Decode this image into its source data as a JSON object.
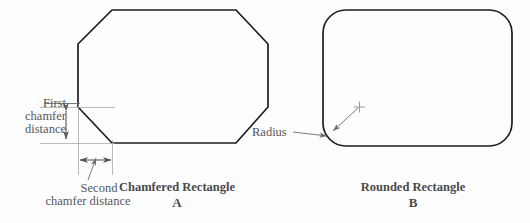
{
  "figure": {
    "background_color": "#fdfdfd",
    "line_color": "#1d1d1f",
    "annotation_color": "#58585a",
    "shapes": [
      {
        "id": "chamfered-rectangle",
        "name": "Chamfered Rectangle",
        "letter": "A",
        "caption": "Chamfered Rectangle",
        "dimensions": [
          {
            "id": "first-chamfer-distance",
            "label_line_1": "First",
            "label_line_2": "chamfer",
            "label_line_3": "distance",
            "orientation": "vertical"
          },
          {
            "id": "second-chamfer-distance",
            "label_line_1": "Second",
            "label_line_2": "chamfer distance",
            "orientation": "horizontal"
          }
        ]
      },
      {
        "id": "rounded-rectangle",
        "name": "Rounded Rectangle",
        "letter": "B",
        "caption": "Rounded Rectangle",
        "dimensions": [
          {
            "id": "radius",
            "label_line_1": "Radius",
            "orientation": "leader"
          }
        ]
      }
    ]
  },
  "labels": {
    "first_chamfer_line1": "First",
    "first_chamfer_line2": "chamfer",
    "first_chamfer_line3": "distance",
    "second_chamfer_line1": "Second",
    "second_chamfer_line2": "chamfer distance",
    "radius": "Radius",
    "chamfered_caption": "Chamfered Rectangle",
    "chamfered_letter": "A",
    "rounded_caption": "Rounded Rectangle",
    "rounded_letter": "B"
  }
}
